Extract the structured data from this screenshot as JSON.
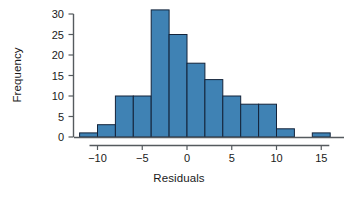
{
  "chart_data": {
    "type": "bar",
    "title": "",
    "subtitle": "",
    "xlabel": "Residuals",
    "ylabel": "Frequency",
    "xlim": [
      -13,
      17
    ],
    "ylim": [
      0,
      31
    ],
    "grid": false,
    "legend": false,
    "bin_width": 2,
    "bar_color": "#3F82B4",
    "bar_edge_color": "#13233A",
    "axis_color": "#555A5E",
    "xticks": [
      -10,
      -5,
      0,
      5,
      10,
      15
    ],
    "xtick_labels": [
      "−10",
      "−5",
      "0",
      "5",
      "10",
      "15"
    ],
    "yticks": [
      0,
      5,
      10,
      15,
      20,
      25,
      30
    ],
    "ytick_labels": [
      "0",
      "5",
      "10",
      "15",
      "20",
      "25",
      "30"
    ],
    "bins": [
      {
        "left": -12,
        "right": -10,
        "value": 1
      },
      {
        "left": -10,
        "right": -8,
        "value": 3
      },
      {
        "left": -8,
        "right": -6,
        "value": 10
      },
      {
        "left": -6,
        "right": -4,
        "value": 10
      },
      {
        "left": -4,
        "right": -2,
        "value": 31
      },
      {
        "left": -2,
        "right": 0,
        "value": 25
      },
      {
        "left": 0,
        "right": 2,
        "value": 18
      },
      {
        "left": 2,
        "right": 4,
        "value": 14
      },
      {
        "left": 4,
        "right": 6,
        "value": 10
      },
      {
        "left": 6,
        "right": 8,
        "value": 8
      },
      {
        "left": 8,
        "right": 10,
        "value": 8
      },
      {
        "left": 10,
        "right": 12,
        "value": 2
      },
      {
        "left": 12,
        "right": 14,
        "value": 0
      },
      {
        "left": 14,
        "right": 16,
        "value": 1
      }
    ],
    "categories": [
      "-12 to -10",
      "-10 to -8",
      "-8 to -6",
      "-6 to -4",
      "-4 to -2",
      "-2 to 0",
      "0 to 2",
      "2 to 4",
      "4 to 6",
      "6 to 8",
      "8 to 10",
      "10 to 12",
      "12 to 14",
      "14 to 16"
    ],
    "values": [
      1,
      3,
      10,
      10,
      31,
      25,
      18,
      14,
      10,
      8,
      8,
      2,
      0,
      1
    ]
  },
  "axis": {
    "x_title": "Residuals",
    "y_title": "Frequency"
  }
}
